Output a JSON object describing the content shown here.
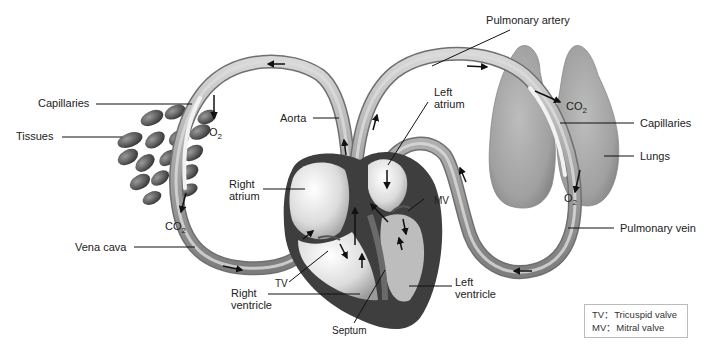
{
  "diagram": {
    "labels": {
      "pulmonary_artery": "Pulmonary artery",
      "capillaries_body": "Capillaries",
      "tissues": "Tissues",
      "aorta": "Aorta",
      "left_atrium_line1": "Left",
      "left_atrium_line2": "atrium",
      "capillaries_lungs": "Capillaries",
      "lungs": "Lungs",
      "right_atrium_line1": "Right",
      "right_atrium_line2": "atrium",
      "mv": "MV",
      "vena_cava": "Vena cava",
      "pulmonary_vein": "Pulmonary vein",
      "tv": "TV",
      "right_ventricle_line1": "Right",
      "right_ventricle_line2": "ventricle",
      "left_ventricle_line1": "Left",
      "left_ventricle_line2": "ventricle",
      "septum": "Septum"
    },
    "gases": {
      "o2_body": "O",
      "o2_body_sub": "2",
      "co2_body": "CO",
      "co2_body_sub": "2",
      "co2_lungs": "CO",
      "co2_lungs_sub": "2",
      "o2_lungs": "O",
      "o2_lungs_sub": "2"
    },
    "legend": [
      {
        "abbr": "TV",
        "sep": "：",
        "meaning": "Tricuspid valve"
      },
      {
        "abbr": "MV",
        "sep": "：",
        "meaning": "Mitral valve"
      }
    ],
    "colors": {
      "vessel": "#a9a9a9",
      "heart_outer": "#3a3a3a",
      "lung": "#9c9c9c",
      "tissue_cell": "#5a5a5a"
    }
  }
}
